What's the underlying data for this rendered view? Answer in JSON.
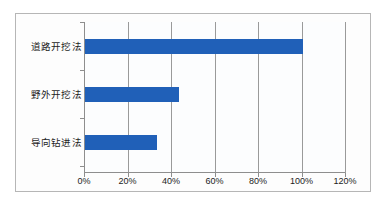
{
  "chart_data": {
    "type": "bar",
    "orientation": "horizontal",
    "title": "",
    "subtitle": "",
    "xlabel": "",
    "ylabel": "",
    "categories": [
      "道路开挖法",
      "野外开挖法",
      "导向钻进法"
    ],
    "values": [
      100,
      43,
      33
    ],
    "value_suffix": "%",
    "xlim": [
      0,
      120
    ],
    "xticks": [
      0,
      20,
      40,
      60,
      80,
      100,
      120
    ],
    "xtick_labels": [
      "0%",
      "20%",
      "40%",
      "60%",
      "80%",
      "100%",
      "120%"
    ],
    "grid": "vertical",
    "legend": "none",
    "series": [
      {
        "name": "",
        "color": "#2060b8",
        "values": [
          100,
          43,
          33
        ]
      }
    ],
    "colors": {
      "bar": "#2060b8",
      "gridline": "#9a9a9a",
      "axis": "#8e8e8e",
      "frame": "#b6b6b6",
      "plot_background": "#fcfdfe",
      "page_background": "#ffffff",
      "text": "#1c1c1c"
    }
  }
}
